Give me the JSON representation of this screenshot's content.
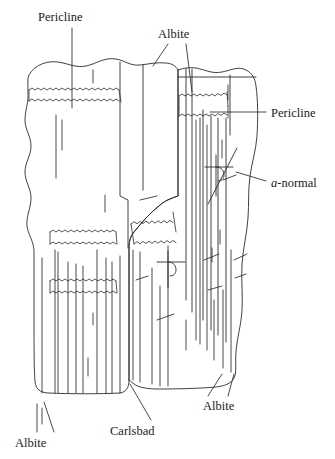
{
  "figure": {
    "type": "diagram",
    "width": 335,
    "height": 459,
    "background_color": "#ffffff",
    "line_color": "#2b2b2b",
    "text_color": "#1a1a1a"
  },
  "labels": [
    {
      "id": "pericline-top-left",
      "text": "Pericline",
      "x": 38,
      "y": 11,
      "leader": "vertical-down"
    },
    {
      "id": "albite-top",
      "text": "Albite",
      "x": 158,
      "y": 28,
      "leader": "two-down"
    },
    {
      "id": "pericline-right",
      "text": "Pericline",
      "x": 271,
      "y": 107,
      "leader": "horizontal-left"
    },
    {
      "id": "a-normal-right",
      "italic_prefix": "a",
      "text_rest": "-normal",
      "text": "a-normal",
      "x": 271,
      "y": 177,
      "leader": "diagonal-left"
    },
    {
      "id": "albite-bottom-right",
      "text": "Albite",
      "x": 203,
      "y": 400,
      "leader": "two-up"
    },
    {
      "id": "carlsbad-bottom",
      "text": "Carlsbad",
      "x": 110,
      "y": 425,
      "leader": "diagonal-up-right"
    },
    {
      "id": "albite-bottom-left",
      "text": "Albite",
      "x": 15,
      "y": 437,
      "leader": "two-up"
    }
  ],
  "legend_terms": [
    "Pericline",
    "Albite",
    "Carlsbad",
    "a-normal"
  ]
}
